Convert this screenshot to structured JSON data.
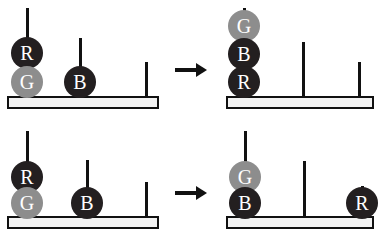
{
  "figure": {
    "panel_count": 4,
    "colors": {
      "disc_red": "#231f20",
      "disc_blue": "#231f20",
      "disc_green": "#8d8d8d",
      "outline": "#111111",
      "base_fill": "#f2f2f2",
      "label_text": "#ffffff",
      "background": "#ffffff"
    }
  },
  "panels": [
    {
      "id": "top-left",
      "role": "start-state",
      "row": 1,
      "column": "left",
      "base": {
        "x": 7,
        "y": 96,
        "width": 152,
        "height": 13
      },
      "pegs": [
        {
          "index": 1,
          "x": 27,
          "top": 8,
          "height": 88
        },
        {
          "index": 2,
          "x": 80,
          "top": 38,
          "height": 58
        },
        {
          "index": 3,
          "x": 146,
          "top": 62,
          "height": 34
        }
      ],
      "discs": [
        {
          "label": "R",
          "color": "dark",
          "peg": 1,
          "level": 2,
          "cx": 27,
          "cy": 53,
          "r": 16
        },
        {
          "label": "G",
          "color": "gray",
          "peg": 1,
          "level": 1,
          "cx": 27,
          "cy": 82,
          "r": 16
        },
        {
          "label": "B",
          "color": "dark",
          "peg": 2,
          "level": 1,
          "cx": 80,
          "cy": 82,
          "r": 16
        }
      ]
    },
    {
      "id": "top-right",
      "role": "goal-state",
      "row": 1,
      "column": "right",
      "base": {
        "x": 226,
        "y": 96,
        "width": 148,
        "height": 13
      },
      "pegs": [
        {
          "index": 1,
          "x": 244,
          "top": 8,
          "height": 88
        },
        {
          "index": 2,
          "x": 303,
          "top": 42,
          "height": 54
        },
        {
          "index": 3,
          "x": 359,
          "top": 62,
          "height": 34
        }
      ],
      "discs": [
        {
          "label": "G",
          "color": "gray",
          "peg": 1,
          "level": 3,
          "cx": 244,
          "cy": 26,
          "r": 16
        },
        {
          "label": "B",
          "color": "dark",
          "peg": 1,
          "level": 2,
          "cx": 244,
          "cy": 54,
          "r": 16
        },
        {
          "label": "R",
          "color": "dark",
          "peg": 1,
          "level": 1,
          "cx": 244,
          "cy": 82,
          "r": 16
        }
      ]
    },
    {
      "id": "bottom-left",
      "role": "start-state",
      "row": 2,
      "column": "left",
      "base": {
        "x": 7,
        "y": 216,
        "width": 152,
        "height": 13
      },
      "pegs": [
        {
          "index": 1,
          "x": 27,
          "top": 131,
          "height": 85
        },
        {
          "index": 2,
          "x": 87,
          "top": 160,
          "height": 56
        },
        {
          "index": 3,
          "x": 146,
          "top": 182,
          "height": 34
        }
      ],
      "discs": [
        {
          "label": "R",
          "color": "dark",
          "peg": 1,
          "level": 2,
          "cx": 27,
          "cy": 177,
          "r": 16
        },
        {
          "label": "G",
          "color": "gray",
          "peg": 1,
          "level": 1,
          "cx": 27,
          "cy": 203,
          "r": 16
        },
        {
          "label": "B",
          "color": "dark",
          "peg": 2,
          "level": 1,
          "cx": 87,
          "cy": 203,
          "r": 16
        }
      ]
    },
    {
      "id": "bottom-right",
      "role": "goal-state",
      "row": 2,
      "column": "right",
      "base": {
        "x": 226,
        "y": 216,
        "width": 148,
        "height": 13
      },
      "pegs": [
        {
          "index": 1,
          "x": 245,
          "top": 131,
          "height": 85
        },
        {
          "index": 2,
          "x": 304,
          "top": 161,
          "height": 55
        },
        {
          "index": 3,
          "x": 362,
          "top": 186,
          "height": 30
        }
      ],
      "discs": [
        {
          "label": "G",
          "color": "gray",
          "peg": 1,
          "level": 2,
          "cx": 245,
          "cy": 177,
          "r": 16
        },
        {
          "label": "B",
          "color": "dark",
          "peg": 1,
          "level": 1,
          "cx": 245,
          "cy": 203,
          "r": 16
        },
        {
          "label": "R",
          "color": "dark",
          "peg": 3,
          "level": 1,
          "cx": 362,
          "cy": 203,
          "r": 16
        }
      ]
    }
  ],
  "arrows": [
    {
      "id": "arrow-top",
      "x": 175,
      "y": 68,
      "length": 32
    },
    {
      "id": "arrow-bottom",
      "x": 175,
      "y": 191,
      "length": 32
    }
  ],
  "disc_labels": {
    "red": "R",
    "green": "G",
    "blue": "B"
  }
}
